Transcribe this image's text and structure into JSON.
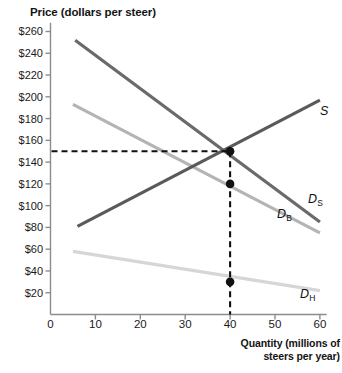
{
  "chart_data": {
    "type": "line",
    "title": "",
    "ylabel": "Price (dollars per steer)",
    "xlabel": "Quantity (millions of steers per year)",
    "xlabel_line1": "Quantity (millions of",
    "xlabel_line2": "steers per year)",
    "xlim": [
      0,
      62
    ],
    "ylim": [
      0,
      272
    ],
    "xticks": [
      0,
      10,
      20,
      30,
      40,
      50,
      60
    ],
    "yticks": [
      20,
      40,
      60,
      80,
      100,
      120,
      140,
      160,
      180,
      200,
      220,
      240,
      260
    ],
    "ytick_labels": [
      "$20",
      "$40",
      "$60",
      "$80",
      "$100",
      "$120",
      "$140",
      "$160",
      "$180",
      "$200",
      "$220",
      "$240",
      "$260"
    ],
    "xtick_labels": [
      "0",
      "10",
      "20",
      "30",
      "40",
      "50",
      "60"
    ],
    "grid": false,
    "legend_position": "inline-right",
    "series": [
      {
        "name": "S",
        "label": "S",
        "role": "supply",
        "color": "#5a5a5a",
        "width": 3.2,
        "points": [
          [
            6,
            81
          ],
          [
            60,
            197
          ]
        ]
      },
      {
        "name": "D_S",
        "label": "D",
        "sublabel": "S",
        "role": "demand-steak",
        "color": "#6a6a6a",
        "width": 3.2,
        "points": [
          [
            5.5,
            252
          ],
          [
            60,
            85
          ]
        ]
      },
      {
        "name": "D_B",
        "label": "D",
        "sublabel": "B",
        "role": "demand-beef",
        "color": "#b4b4b4",
        "width": 3.2,
        "points": [
          [
            5,
            193
          ],
          [
            60,
            75
          ]
        ]
      },
      {
        "name": "D_H",
        "label": "D",
        "sublabel": "H",
        "role": "demand-hamburger",
        "color": "#d6d6d6",
        "width": 3.2,
        "points": [
          [
            5,
            58
          ],
          [
            60,
            22
          ]
        ]
      }
    ],
    "points": [
      {
        "name": "equilibrium-point",
        "x": 40,
        "y": 150,
        "color": "#111111"
      },
      {
        "name": "beef-point",
        "x": 40,
        "y": 120,
        "color": "#111111"
      },
      {
        "name": "hamburger-point",
        "x": 40,
        "y": 30,
        "color": "#111111"
      }
    ],
    "guide_lines": [
      {
        "name": "price-guide",
        "orientation": "horizontal",
        "value": 150,
        "from": 0,
        "to": 40,
        "style": "dashed"
      },
      {
        "name": "quantity-guide",
        "orientation": "vertical",
        "value": 40,
        "from": 0,
        "to": 150,
        "style": "dashed"
      }
    ],
    "axis_color": "#8c8c8c"
  }
}
